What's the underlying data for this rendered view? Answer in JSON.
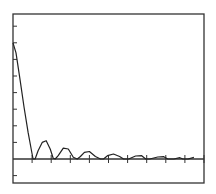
{
  "chart_data": {
    "type": "line",
    "title": "",
    "xlabel": "",
    "ylabel": "",
    "grid": false,
    "legend": null,
    "axis_ranges": {
      "x": [
        0,
        10
      ],
      "y": [
        -1.4,
        11.2
      ]
    },
    "x_ticks": [
      1,
      2,
      3,
      4,
      5,
      6,
      7,
      8,
      9,
      10
    ],
    "y_ticks": [
      -1,
      1,
      2,
      3,
      4,
      5,
      6,
      7,
      8,
      9,
      10
    ],
    "tick_labels_visible": false,
    "series": [
      {
        "name": "magnitude",
        "x": [
          0,
          0.15,
          0.35,
          0.55,
          0.75,
          0.95,
          1.0,
          1.1,
          1.25,
          1.45,
          1.65,
          1.85,
          2.0,
          2.1,
          2.25,
          2.5,
          2.75,
          3.0,
          3.2,
          3.35,
          3.55,
          3.8,
          4.1,
          4.35,
          4.5,
          4.7,
          5.0,
          5.3,
          5.5,
          5.75,
          6.1,
          6.4,
          6.6,
          6.8,
          7.2,
          7.5,
          7.7,
          8.0,
          8.3,
          8.45,
          8.7,
          9.0
        ],
        "y": [
          7.0,
          6.4,
          4.8,
          3.1,
          1.6,
          0.3,
          0.0,
          0.0,
          0.5,
          1.0,
          1.1,
          0.6,
          0.05,
          0.0,
          0.2,
          0.65,
          0.6,
          0.1,
          0.0,
          0.15,
          0.4,
          0.45,
          0.15,
          0.0,
          0.0,
          0.2,
          0.3,
          0.15,
          0.0,
          0.0,
          0.18,
          0.2,
          0.0,
          0.0,
          0.12,
          0.14,
          0.0,
          0.0,
          0.08,
          0.0,
          0.0,
          0.1
        ]
      }
    ]
  },
  "plot": {
    "frame_color": "#333333",
    "curve_color": "#222222",
    "baseline_color": "#333333"
  }
}
